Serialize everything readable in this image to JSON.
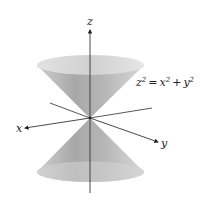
{
  "figure": {
    "type": "3d-surface-diagram",
    "equation": {
      "lhs_var": "z",
      "lhs_exp": "2",
      "equals": "=",
      "term1_var": "x",
      "term1_exp": "2",
      "plus": "+",
      "term2_var": "y",
      "term2_exp": "2"
    },
    "axes": {
      "z_label": "z",
      "x_label": "x",
      "y_label": "y"
    },
    "colors": {
      "cone_fill": "#bdbdbd",
      "cone_dark": "#9a9a9a",
      "cone_rim": "#d6d6d6",
      "axis": "#333333",
      "background": "#ffffff"
    }
  }
}
